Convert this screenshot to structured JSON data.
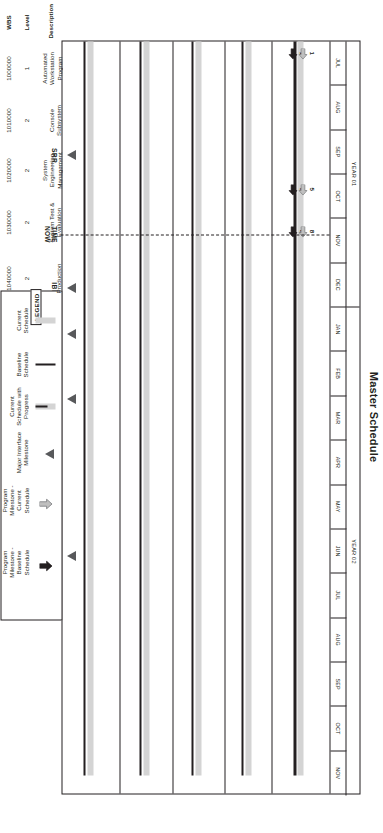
{
  "title": "Master Schedule",
  "timeline": {
    "years": [
      {
        "label": "YEAR 01",
        "months": [
          "JUL",
          "AUG",
          "SEP",
          "OCT",
          "NOV",
          "DEC"
        ]
      },
      {
        "label": "YEAR 02",
        "months": [
          "JAN",
          "FEB",
          "MAR",
          "APR",
          "MAY",
          "JUN",
          "JUL",
          "AUG",
          "SEP",
          "OCT",
          "NOV"
        ]
      }
    ],
    "time_now_label_line1": "TIME",
    "time_now_label_line2": "NOW",
    "time_now_month_index": 4.35
  },
  "table": {
    "headers": {
      "wbs": "WBS",
      "level": "Level",
      "description": "Description"
    },
    "rows": [
      {
        "wbs": "1000000",
        "level": "1",
        "description": "Automated Workstation Program"
      },
      {
        "wbs": "1010000",
        "level": "2",
        "description": "Console Subsystem"
      },
      {
        "wbs": "1020000",
        "level": "2",
        "description": "System Engineering Management"
      },
      {
        "wbs": "1030000",
        "level": "2",
        "description": "System Test & Evaluation"
      },
      {
        "wbs": "1040000",
        "level": "2",
        "description": "Production"
      }
    ]
  },
  "bars": [
    {
      "row": 0,
      "type": "current",
      "start": 0.0,
      "end": 16.55
    },
    {
      "row": 0,
      "type": "baseline",
      "start": 0.0,
      "end": 16.55
    },
    {
      "row": 1,
      "type": "current",
      "start": 0.0,
      "end": 16.55
    },
    {
      "row": 1,
      "type": "baseline",
      "start": 0.0,
      "end": 16.55
    },
    {
      "row": 2,
      "type": "current",
      "start": 0.0,
      "end": 16.55
    },
    {
      "row": 2,
      "type": "baseline",
      "start": 0.0,
      "end": 16.55
    },
    {
      "row": 3,
      "type": "current",
      "start": 0.0,
      "end": 16.55
    },
    {
      "row": 3,
      "type": "baseline",
      "start": 0.0,
      "end": 16.55
    },
    {
      "row": 4,
      "type": "current",
      "start": 0.0,
      "end": 16.55
    },
    {
      "row": 4,
      "type": "baseline",
      "start": 0.0,
      "end": 16.55
    }
  ],
  "milestones": [
    {
      "label": "SRR",
      "month": 2.55
    },
    {
      "label": "IBR",
      "month": 5.55
    },
    {
      "label": "PDR",
      "month": 6.6
    },
    {
      "label": "EPA",
      "month": 8.05
    },
    {
      "label": "SSR",
      "month": 11.6
    }
  ],
  "program_milestones": [
    {
      "number": "1",
      "month": 0.28,
      "kind": "baseline"
    },
    {
      "number": "1",
      "month": 0.28,
      "kind": "current"
    },
    {
      "number": "5",
      "month": 3.35,
      "kind": "baseline"
    },
    {
      "number": "5",
      "month": 3.35,
      "kind": "current"
    },
    {
      "number": "8",
      "month": 4.3,
      "kind": "baseline"
    },
    {
      "number": "8",
      "month": 4.3,
      "kind": "current"
    }
  ],
  "legend": {
    "title": "LEGEND",
    "items": [
      {
        "swatch": "current-schedule-swatch",
        "label": "Current Schedule"
      },
      {
        "swatch": "baseline-schedule-swatch",
        "label": "Baseline Schedule"
      },
      {
        "swatch": "current-schedule-progress-swatch",
        "label": "Current Schedule with Progress"
      },
      {
        "swatch": "major-interface-milestone-icon",
        "label": "Major Interface Milestone"
      },
      {
        "swatch": "program-milestone-current-icon",
        "label": "Program Milestone - Current Schedule"
      },
      {
        "swatch": "program-milestone-baseline-icon",
        "label": "Program Milestone - Baseline Schedule"
      }
    ]
  },
  "colors": {
    "ink": "#231f20",
    "current_bar": "#d4d4d4",
    "baseline_bar": "#231f20",
    "milestone_fill": "#58595b"
  }
}
